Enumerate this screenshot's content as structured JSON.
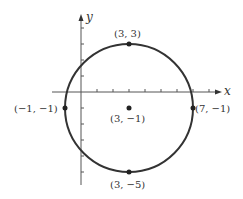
{
  "diagram": {
    "type": "circle-on-coordinate-plane",
    "axes": {
      "x_label": "x",
      "y_label": "y"
    },
    "circle": {
      "center": [
        3,
        -1
      ],
      "radius": 4
    },
    "points": [
      {
        "id": "top",
        "label": "(3, 3)"
      },
      {
        "id": "left",
        "label": "(−1, −1)"
      },
      {
        "id": "center",
        "label": "(3, −1)"
      },
      {
        "id": "right",
        "label": "(7, −1)"
      },
      {
        "id": "bottom",
        "label": "(3, −5)"
      }
    ],
    "colors": {
      "stroke": "#333333",
      "axis": "#444444",
      "background": "#ffffff"
    }
  }
}
